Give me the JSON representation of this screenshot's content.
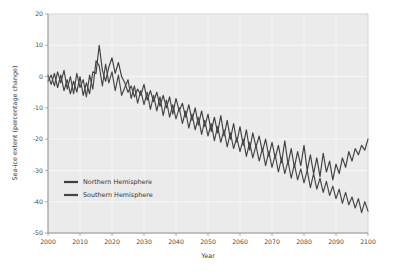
{
  "chart_data": {
    "type": "line",
    "title": "",
    "xlabel": "Year",
    "ylabel": "Sea-ice extent (percentage change)",
    "xlim": [
      2000,
      2100
    ],
    "ylim": [
      -50,
      20
    ],
    "xticks": [
      2000,
      2010,
      2020,
      2030,
      2040,
      2050,
      2060,
      2070,
      2080,
      2090,
      2100
    ],
    "xticklabels": [
      "2000",
      "2010",
      "2020",
      "2030",
      "2040",
      "2050",
      "2060",
      "2070",
      "2080",
      "2090",
      "2100"
    ],
    "yticks": [
      20,
      10,
      0,
      -10,
      -20,
      -30,
      -40,
      -50
    ],
    "yticklabels": [
      "20",
      "10",
      "0",
      "-10",
      "-20",
      "-30",
      "-40",
      "-50"
    ],
    "grid": true,
    "legend_position": "center-left",
    "x": [
      2000,
      2001,
      2002,
      2003,
      2004,
      2005,
      2006,
      2007,
      2008,
      2009,
      2010,
      2011,
      2012,
      2013,
      2014,
      2015,
      2016,
      2017,
      2018,
      2019,
      2020,
      2021,
      2022,
      2023,
      2024,
      2025,
      2026,
      2027,
      2028,
      2029,
      2030,
      2031,
      2032,
      2033,
      2034,
      2035,
      2036,
      2037,
      2038,
      2039,
      2040,
      2041,
      2042,
      2043,
      2044,
      2045,
      2046,
      2047,
      2048,
      2049,
      2050,
      2051,
      2052,
      2053,
      2054,
      2055,
      2056,
      2057,
      2058,
      2059,
      2060,
      2061,
      2062,
      2063,
      2064,
      2065,
      2066,
      2067,
      2068,
      2069,
      2070,
      2071,
      2072,
      2073,
      2074,
      2075,
      2076,
      2077,
      2078,
      2079,
      2080,
      2081,
      2082,
      2083,
      2084,
      2085,
      2086,
      2087,
      2088,
      2089,
      2090,
      2091,
      2092,
      2093,
      2094,
      2095,
      2096,
      2097,
      2098,
      2099,
      2100
    ],
    "series": [
      {
        "name": "Northern Hemisphere",
        "color": "#3f3f3f",
        "values": [
          0.5,
          -2.5,
          1.0,
          -3.5,
          0.5,
          -4.5,
          -1.0,
          -5.5,
          -1.5,
          -5.0,
          0.0,
          -6.0,
          -2.0,
          -5.5,
          1.5,
          1.0,
          10.0,
          2.0,
          -1.5,
          3.0,
          6.0,
          1.0,
          4.5,
          0.0,
          -2.0,
          -5.0,
          -3.0,
          -6.5,
          -4.0,
          -6.0,
          -2.5,
          -7.5,
          -4.5,
          -8.0,
          -5.0,
          -9.5,
          -6.0,
          -10.0,
          -6.5,
          -12.0,
          -7.0,
          -11.0,
          -8.5,
          -13.0,
          -9.0,
          -14.0,
          -10.0,
          -15.5,
          -11.0,
          -16.0,
          -12.0,
          -17.5,
          -13.0,
          -18.0,
          -12.5,
          -19.0,
          -14.0,
          -20.0,
          -15.0,
          -21.0,
          -16.0,
          -22.0,
          -17.0,
          -23.5,
          -18.0,
          -22.5,
          -19.0,
          -24.0,
          -20.0,
          -25.5,
          -21.0,
          -26.0,
          -22.0,
          -27.5,
          -20.5,
          -28.0,
          -23.0,
          -29.0,
          -24.0,
          -28.5,
          -22.0,
          -30.0,
          -25.0,
          -31.0,
          -26.0,
          -32.0,
          -24.5,
          -30.5,
          -27.0,
          -33.0,
          -28.0,
          -31.0,
          -26.0,
          -29.0,
          -24.0,
          -27.0,
          -23.0,
          -25.0,
          -22.0,
          -23.5,
          -20.0
        ]
      },
      {
        "name": "Southern Hemisphere",
        "color": "#454545",
        "values": [
          -1.5,
          0.5,
          -3.0,
          1.5,
          -2.0,
          2.0,
          -4.0,
          0.0,
          -5.5,
          1.0,
          -3.5,
          -1.0,
          -6.5,
          0.5,
          -4.0,
          5.0,
          3.5,
          -3.0,
          4.0,
          -2.0,
          1.5,
          -4.5,
          0.5,
          -6.0,
          -3.5,
          -1.0,
          -7.0,
          -3.0,
          -8.5,
          -4.5,
          -9.0,
          -5.0,
          -10.5,
          -6.0,
          -11.0,
          -6.5,
          -12.5,
          -7.5,
          -13.0,
          -9.0,
          -13.5,
          -10.0,
          -15.0,
          -11.0,
          -16.5,
          -12.0,
          -17.0,
          -13.0,
          -18.5,
          -14.0,
          -19.0,
          -15.0,
          -20.5,
          -16.0,
          -21.0,
          -17.0,
          -22.5,
          -18.0,
          -23.0,
          -19.5,
          -24.0,
          -20.0,
          -25.5,
          -21.0,
          -26.0,
          -22.0,
          -27.0,
          -23.0,
          -28.5,
          -24.0,
          -29.0,
          -25.0,
          -30.5,
          -26.0,
          -31.0,
          -27.0,
          -32.5,
          -28.0,
          -33.0,
          -29.5,
          -34.0,
          -30.0,
          -35.5,
          -31.0,
          -36.0,
          -32.5,
          -37.0,
          -33.5,
          -38.0,
          -35.0,
          -39.0,
          -36.0,
          -40.5,
          -37.0,
          -41.0,
          -38.5,
          -42.0,
          -39.0,
          -43.5,
          -40.0,
          -43.0
        ]
      }
    ]
  }
}
